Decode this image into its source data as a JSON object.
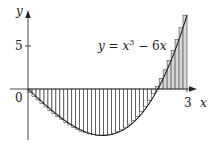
{
  "chart_data": {
    "type": "area",
    "title": "",
    "equation_label": {
      "y": "y",
      "eq": " = ",
      "x": "x",
      "exp": "3",
      "rest": " − 6",
      "x2": "x"
    },
    "xlabel": "x",
    "ylabel": "y",
    "x_ticks": [
      {
        "value": 0,
        "label": "0"
      },
      {
        "value": 3,
        "label": "3"
      }
    ],
    "y_ticks": [
      {
        "value": 5,
        "label": "5"
      }
    ],
    "xlim": [
      -0.35,
      3.15
    ],
    "ylim": [
      -6.2,
      9.3
    ],
    "function": "x^3 - 6x",
    "riemann": {
      "method": "right",
      "a": 0,
      "b": 3,
      "n": 40
    },
    "curve_samples": {
      "x": [
        0,
        0.25,
        0.5,
        0.75,
        1.0,
        1.25,
        1.414,
        1.5,
        1.75,
        2.0,
        2.25,
        2.449,
        2.5,
        2.75,
        3.0
      ],
      "y": [
        0,
        -1.48,
        -2.88,
        -4.08,
        -5.0,
        -5.55,
        -5.66,
        -5.63,
        -5.14,
        -4.0,
        -2.11,
        0,
        0.63,
        4.3,
        9.0
      ]
    },
    "grid": false,
    "legend": "none",
    "colors": {
      "axis": "#333333",
      "curve": "#222222",
      "bar_fill": "#d9d9d9",
      "bar_stroke": "#444444"
    }
  }
}
